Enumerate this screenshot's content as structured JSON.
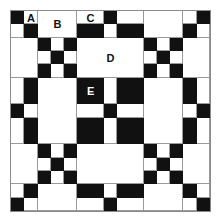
{
  "diagram": {
    "type": "quilt-block",
    "grid_units": 15,
    "column_widths_units": [
      1,
      1,
      3,
      2,
      1,
      2,
      3,
      1,
      1
    ],
    "row_heights_units": [
      1,
      1,
      3,
      2,
      1,
      2,
      3,
      1,
      1
    ],
    "colors": {
      "dark": "#111111",
      "light": "#ffffff",
      "line": "#9a9a9a"
    },
    "labels": [
      {
        "text": "A",
        "row": 0,
        "col": 1,
        "on_dark": false
      },
      {
        "text": "B",
        "row": 0,
        "col": 2,
        "row_span": 2,
        "on_dark": false
      },
      {
        "text": "C",
        "row": 0,
        "col": 3,
        "on_dark": false
      },
      {
        "text": "D",
        "row": 2,
        "col": 3,
        "col_span": 3,
        "on_dark": false
      },
      {
        "text": "E",
        "row": 3,
        "col": 3,
        "on_dark": true
      }
    ],
    "pattern_rows": [
      "BWWWBWWWB",
      "WBWBWBWBW",
      "WWNWWWNWW",
      "WBWBWBWBW",
      "BWWWBWWWB",
      "WBWBWBWBW",
      "WWNWWWNWW",
      "WBWBWBWBW",
      "BWWWBWWWB"
    ],
    "legend": "B = dark patch, W = light patch, N = nine-patch (3x3 alternating, dark corners and center)"
  }
}
